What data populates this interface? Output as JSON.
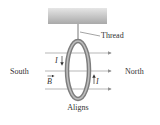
{
  "diagram": {
    "labels": {
      "thread": "Thread",
      "south": "South",
      "north": "North",
      "current_left": "I",
      "current_right": "I",
      "field": "B",
      "caption": "Aligns"
    },
    "colors": {
      "ceiling": "#b8b8b8",
      "ring": "#8a8a8a",
      "lines": "#9a9a9a",
      "text": "#333333"
    }
  }
}
